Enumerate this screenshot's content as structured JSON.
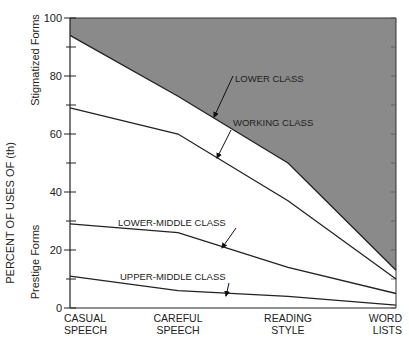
{
  "chart_data": {
    "type": "line",
    "title": "",
    "xlabel": "",
    "ylabel": "PERCENT OF USES OF (th)",
    "y_side_labels": {
      "upper": "Stigmatized Forms",
      "lower": "Prestige Forms"
    },
    "ylim": [
      0,
      100
    ],
    "yticks": [
      0,
      20,
      40,
      60,
      80,
      100
    ],
    "grid": false,
    "legend": "inline annotations with arrows",
    "shaded_region": {
      "above_series": "LOWER CLASS",
      "color": "#8a8a8a"
    },
    "categories": [
      "CASUAL SPEECH",
      "CAREFUL SPEECH",
      "READING STYLE",
      "WORD LISTS"
    ],
    "category_lines": [
      [
        "CASUAL",
        "SPEECH"
      ],
      [
        "CAREFUL",
        "SPEECH"
      ],
      [
        "READING",
        "STYLE"
      ],
      [
        "WORD",
        "LISTS"
      ]
    ],
    "series": [
      {
        "name": "LOWER CLASS",
        "values": [
          94,
          73,
          50,
          13
        ]
      },
      {
        "name": "WORKING CLASS",
        "values": [
          69,
          60,
          37,
          10
        ]
      },
      {
        "name": "LOWER-MIDDLE CLASS",
        "values": [
          29,
          26,
          14,
          5
        ]
      },
      {
        "name": "UPPER-MIDDLE CLASS",
        "values": [
          11,
          6,
          4,
          1
        ]
      }
    ]
  }
}
